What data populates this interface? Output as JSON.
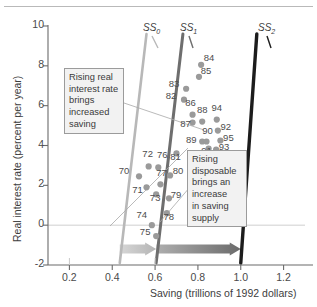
{
  "figure": {
    "y_axis_title": "Real interest rate (percent per year)",
    "x_axis_title": "Saving (trillions of 1992 dollars)"
  },
  "callouts": {
    "left": "Rising real\ninterest rate\nbrings\nincreased\nsaving",
    "right": "Rising\ndisposable\nbrings an\nincrease\nin saving\nsupply"
  },
  "curve_labels": [
    {
      "name": "SS",
      "sub": "0"
    },
    {
      "name": "SS",
      "sub": "1"
    },
    {
      "name": "SS",
      "sub": "2"
    }
  ],
  "colors": {
    "ss0": "#b8b8b8",
    "ss1": "#6e6e6e",
    "ss2": "#1c1c1c",
    "point": "#9a9a9a",
    "axis": "#6b6b6b",
    "zero_line": "#cfcfcf",
    "arrow_light": "#b5b5b5",
    "arrow_dark": "#6b6b6b",
    "callout_bg": "#f2f2f2",
    "callout_border": "#9b9b9b"
  },
  "chart_data": {
    "type": "scatter",
    "title": "",
    "xlabel": "Saving (trillions of 1992 dollars)",
    "ylabel": "Real interest rate (percent per year)",
    "xlim": [
      0.1,
      1.3
    ],
    "ylim": [
      -2,
      10
    ],
    "xticks": [
      "0.2",
      "0.4",
      "0.6",
      "0.8",
      "1.0",
      "1.2"
    ],
    "xtick_values": [
      0.2,
      0.4,
      0.6,
      0.8,
      1.0,
      1.2
    ],
    "yticks": [
      "10",
      "8",
      "6",
      "4",
      "2",
      "0",
      "-2"
    ],
    "ytick_values": [
      10,
      8,
      6,
      4,
      2,
      0,
      -2
    ],
    "grid": false,
    "legend": "none",
    "points": [
      {
        "label": "70",
        "x": 0.525,
        "y": 2.45,
        "lx": -18,
        "ly": -4
      },
      {
        "label": "71",
        "x": 0.56,
        "y": 1.9,
        "lx": -12,
        "ly": 4
      },
      {
        "label": "72",
        "x": 0.57,
        "y": 2.95,
        "lx": -4,
        "ly": -11
      },
      {
        "label": "73",
        "x": 0.605,
        "y": 1.55,
        "lx": -4,
        "ly": 5
      },
      {
        "label": "74",
        "x": 0.585,
        "y": 0.0,
        "lx": -13,
        "ly": -9
      },
      {
        "label": "75",
        "x": 0.605,
        "y": -0.55,
        "lx": -14,
        "ly": -3
      },
      {
        "label": "76",
        "x": 0.615,
        "y": 2.9,
        "lx": 1,
        "ly": -11
      },
      {
        "label": "77",
        "x": 0.625,
        "y": 2.05,
        "lx": -2,
        "ly": -10
      },
      {
        "label": "78",
        "x": 0.655,
        "y": 0.6,
        "lx": -1,
        "ly": 5
      },
      {
        "label": "79",
        "x": 0.665,
        "y": 1.35,
        "lx": 4,
        "ly": -2
      },
      {
        "label": "80",
        "x": 0.67,
        "y": 2.5,
        "lx": 5,
        "ly": -3
      },
      {
        "label": "81",
        "x": 0.7,
        "y": 3.6,
        "lx": -4,
        "ly": 5
      },
      {
        "label": "82",
        "x": 0.735,
        "y": 6.3,
        "lx": -16,
        "ly": -3
      },
      {
        "label": "83",
        "x": 0.745,
        "y": 6.85,
        "lx": -15,
        "ly": -4
      },
      {
        "label": "84",
        "x": 0.815,
        "y": 8.05,
        "lx": 5,
        "ly": -6
      },
      {
        "label": "85",
        "x": 0.805,
        "y": 7.45,
        "lx": 4,
        "ly": -5
      },
      {
        "label": "86",
        "x": 0.775,
        "y": 5.55,
        "lx": -5,
        "ly": -11
      },
      {
        "label": "87",
        "x": 0.775,
        "y": 5.15,
        "lx": -10,
        "ly": 2
      },
      {
        "label": "88",
        "x": 0.82,
        "y": 5.2,
        "lx": -3,
        "ly": -11
      },
      {
        "label": "89",
        "x": 0.82,
        "y": 4.2,
        "lx": -14,
        "ly": -1
      },
      {
        "label": "90",
        "x": 0.84,
        "y": 4.2,
        "lx": -2,
        "ly": -10
      },
      {
        "label": "91",
        "x": 0.85,
        "y": 3.85,
        "lx": -5,
        "ly": 4
      },
      {
        "label": "92",
        "x": 0.893,
        "y": 4.75,
        "lx": 5,
        "ly": -3
      },
      {
        "label": "93",
        "x": 0.885,
        "y": 3.8,
        "lx": 5,
        "ly": -1
      },
      {
        "label": "94",
        "x": 0.888,
        "y": 5.3,
        "lx": -3,
        "ly": -11
      },
      {
        "label": "95",
        "x": 0.905,
        "y": 4.25,
        "lx": 5,
        "ly": -2
      },
      {
        "label": "96",
        "x": 0.96,
        "y": 3.45,
        "lx": 6,
        "ly": -2
      }
    ],
    "curves": [
      {
        "name": "SS0",
        "x_bottom": 0.435,
        "x_top": 0.56,
        "color": "#b8b8b8"
      },
      {
        "name": "SS1",
        "x_bottom": 0.605,
        "x_top": 0.73,
        "color": "#6e6e6e"
      },
      {
        "name": "SS2",
        "x_bottom": 1.0,
        "x_top": 1.075,
        "color": "#1c1c1c"
      }
    ],
    "arrows": [
      {
        "name": "shift-0-to-1",
        "x_start": 0.435,
        "x_end": 0.605,
        "y": -1.2,
        "color": "#b5b5b5"
      },
      {
        "name": "shift-1-to-2",
        "x_start": 0.607,
        "x_end": 1.0,
        "y": -1.2,
        "color": "#6b6b6b"
      }
    ]
  }
}
